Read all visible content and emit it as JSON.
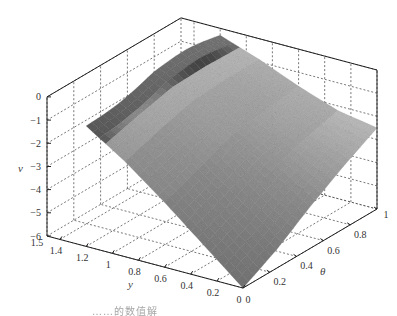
{
  "chart_data": {
    "type": "surface3d",
    "title": "",
    "caption": "……的数值解",
    "axes": {
      "x": {
        "label": "y",
        "range": [
          0,
          1.5
        ],
        "ticks": [
          0,
          0.2,
          0.4,
          0.6,
          0.8,
          1,
          1.2,
          1.4,
          1.5
        ],
        "tick_labels": [
          "0",
          "0.2",
          "0.4",
          "0.6",
          "0.8",
          "1",
          "1.2",
          "1.4",
          "1.5"
        ]
      },
      "y": {
        "label": "θ",
        "range": [
          0,
          1
        ],
        "ticks": [
          0,
          0.2,
          0.4,
          0.6,
          0.8,
          1
        ],
        "tick_labels": [
          "0",
          "0.2",
          "0.4",
          "0.6",
          "0.8",
          "1"
        ]
      },
      "z": {
        "label": "v",
        "range": [
          -6,
          0
        ],
        "ticks": [
          0,
          -1,
          -2,
          -3,
          -4,
          -5,
          -6
        ],
        "tick_labels": [
          "0",
          "-1",
          "-2",
          "-3",
          "-4",
          "-5",
          "-6"
        ]
      }
    },
    "grid": true,
    "colormap": "gray",
    "surface_samples": {
      "y_values": [
        0,
        0.3,
        0.6,
        0.9,
        1.2
      ],
      "theta_values": [
        0,
        0.25,
        0.5,
        0.75,
        1
      ],
      "v": [
        [
          -6.0,
          -5.2,
          -4.2,
          -3.3,
          -2.5
        ],
        [
          -4.6,
          -3.9,
          -3.1,
          -2.6,
          -2.2
        ],
        [
          -3.2,
          -2.6,
          -2.0,
          -1.8,
          -1.6
        ],
        [
          -1.9,
          -1.4,
          -1.0,
          -0.9,
          -0.9
        ],
        [
          -0.8,
          -0.5,
          -0.2,
          -0.2,
          -0.3
        ]
      ]
    },
    "features": {
      "ridge": "sharp ridge along y≈1.2 with local peak near θ≈0.6, v≈-0.2",
      "minimum": "v=-6 at y=0, θ=0",
      "right_edge": "v≈-2.5 at y=0, θ=1"
    }
  },
  "labels": {
    "v_axis": "v",
    "y_axis": "y",
    "theta_axis": "θ"
  }
}
